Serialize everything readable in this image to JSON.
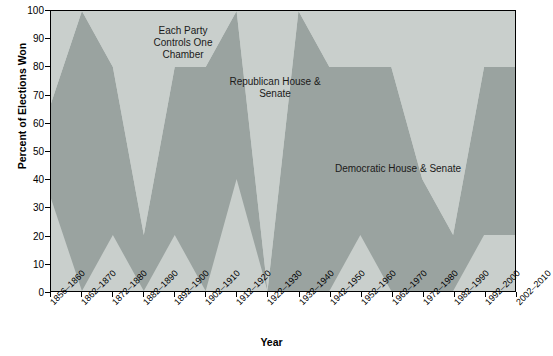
{
  "chart_data": {
    "type": "area",
    "title": "",
    "xlabel": "Year",
    "ylabel": "Percent of Elections Won",
    "ylim": [
      0,
      100
    ],
    "ytick_step": 10,
    "grid": false,
    "stacked": true,
    "stack_total": 100,
    "legend_position": "in-plot-annotations",
    "categories": [
      "1856–1860",
      "1862–1870",
      "1872–1880",
      "1882–1890",
      "1892–1900",
      "1902–1910",
      "1912–1920",
      "1922–1930",
      "1932–1940",
      "1942–1950",
      "1952–1960",
      "1962–1970",
      "1972–1980",
      "1982–1990",
      "1992–2000",
      "2002–2010"
    ],
    "ytick_labels": [
      "0",
      "10",
      "20",
      "30",
      "40",
      "50",
      "60",
      "70",
      "80",
      "90",
      "100"
    ],
    "series": [
      {
        "name": "Republican House & Senate",
        "color": "#c9cfcc",
        "values": [
          33,
          0,
          20,
          0,
          20,
          0,
          40,
          0,
          0,
          0,
          20,
          0,
          0,
          0,
          20,
          20
        ]
      },
      {
        "name": "Each Party Controls One Chamber",
        "color": "#9aa3a0",
        "values": [
          34,
          100,
          60,
          20,
          60,
          80,
          60,
          0,
          100,
          80,
          60,
          80,
          40,
          20,
          60,
          60
        ]
      },
      {
        "name": "Democratic House & Senate",
        "color": "#c9cfcc",
        "values": [
          33,
          0,
          20,
          80,
          20,
          20,
          0,
          100,
          0,
          20,
          20,
          20,
          60,
          80,
          20,
          20
        ]
      }
    ],
    "annotations": [
      {
        "id": "each-party",
        "text": "Each Party\nControls One\nChamber"
      },
      {
        "id": "republican",
        "text": "Republican House &\nSenate"
      },
      {
        "id": "democratic",
        "text": "Democratic House & Senate"
      }
    ],
    "colors": {
      "band_light": "#c9cfcc",
      "band_dark": "#9aa3a0",
      "axis": "#000000",
      "text": "#000000",
      "background": "#ffffff"
    }
  }
}
